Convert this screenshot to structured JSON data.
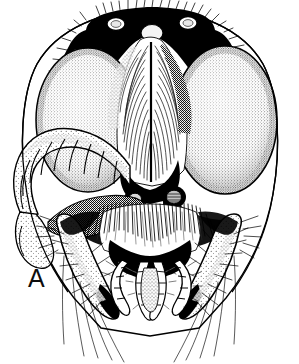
{
  "figure": {
    "panel_label": "A",
    "technique": "stipple-and-line-ink-drawing",
    "background_color": "#ffffff",
    "ink_color": "#000000",
    "width_px": 299,
    "height_px": 364
  },
  "anatomy": {
    "compound_eye_left": {
      "name": "compound-eye-left",
      "shape": "large-oval",
      "texture": "fine-stipple",
      "center_x": 88,
      "center_y": 120,
      "radius_x": 52,
      "radius_y": 72
    },
    "compound_eye_right": {
      "name": "compound-eye-right",
      "shape": "large-oval",
      "texture": "fine-stipple",
      "center_x": 225,
      "center_y": 120,
      "radius_x": 52,
      "radius_y": 74
    },
    "ocelli": [
      {
        "name": "lateral-ocellus-left",
        "cx": 115,
        "cy": 26,
        "r": 6
      },
      {
        "name": "median-ocellus",
        "cx": 152,
        "cy": 34,
        "r": 8
      },
      {
        "name": "lateral-ocellus-right",
        "cx": 188,
        "cy": 25,
        "r": 6
      }
    ],
    "antennal_sockets": [
      {
        "name": "antennal-socket-left",
        "cx": 135,
        "cy": 198,
        "r": 9
      },
      {
        "name": "antennal-socket-right",
        "cx": 173,
        "cy": 196,
        "r": 10
      }
    ],
    "antenna_left": {
      "name": "antenna-left-scape-and-flagellum",
      "segment_count": 9,
      "orientation": "curving-down-and-left-across-eye"
    },
    "mandible_left": {
      "name": "mandible-left",
      "shape": "sickle-curved",
      "tip_x": 112,
      "tip_y": 316
    },
    "mandible_right": {
      "name": "mandible-right",
      "shape": "sickle-curved",
      "tip_x": 206,
      "tip_y": 318
    },
    "palps": {
      "name": "maxillary-and-labial-palps",
      "pairs": 2,
      "segments_per_palp": 5
    },
    "clypeus": {
      "name": "clypeus",
      "texture": "dense-setae"
    },
    "labrum": {
      "name": "labrum",
      "fill": "solid-black"
    },
    "vertex": {
      "name": "vertex-and-frons",
      "fill": "solid-black-with-stipple"
    }
  },
  "colors": {
    "ink": "#000000",
    "paper": "#ffffff",
    "mid_gray": "#5a5a5a",
    "light_gray": "#b8b8b8"
  }
}
